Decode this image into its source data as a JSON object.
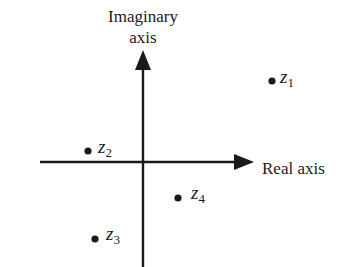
{
  "diagram": {
    "axes": {
      "imaginary_label_line1": "Imaginary",
      "imaginary_label_line2": "axis",
      "real_label": "Real axis"
    },
    "points": [
      {
        "name": "z",
        "sub": "1",
        "quadrant": "I"
      },
      {
        "name": "z",
        "sub": "2",
        "quadrant": "II"
      },
      {
        "name": "z",
        "sub": "3",
        "quadrant": "III"
      },
      {
        "name": "z",
        "sub": "4",
        "quadrant": "IV"
      }
    ],
    "colors": {
      "ink": "#1a1a1a",
      "background": "#ffffff"
    }
  }
}
